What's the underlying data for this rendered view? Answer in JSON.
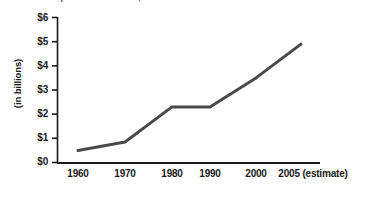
{
  "caption": {
    "text": "Source: U.S. Department of Education, National Center for Education Statistics"
  },
  "colors": {
    "line": "#4a4a4a",
    "axis": "#1a1a1a",
    "text": "#1a1a1a",
    "background": "#ffffff"
  },
  "chart_data": {
    "type": "line",
    "title": "",
    "xlabel": "",
    "ylabel": "(in billions)",
    "categories": [
      "1960",
      "1970",
      "1980",
      "1990",
      "2000",
      "2005 (estimate)"
    ],
    "x": [
      1960,
      1970,
      1980,
      1990,
      2000,
      2005
    ],
    "values": [
      0.5,
      0.85,
      2.3,
      2.3,
      3.5,
      4.9
    ],
    "series": [
      {
        "name": "Amount",
        "values": [
          0.5,
          0.85,
          2.3,
          2.3,
          3.5,
          4.9
        ]
      }
    ],
    "ylim": [
      0,
      6
    ],
    "ytick_labels": [
      "$0",
      "$1",
      "$2",
      "$3",
      "$4",
      "$5",
      "$6"
    ],
    "ytick_values": [
      0,
      1,
      2,
      3,
      4,
      5,
      6
    ],
    "xtick_labels": [
      "1960",
      "1970",
      "1980",
      "1990",
      "2000",
      "2005 (estimate)"
    ],
    "grid": false,
    "legend": false,
    "legend_position": "none",
    "markers": false,
    "line_width": 3,
    "annotations": []
  }
}
